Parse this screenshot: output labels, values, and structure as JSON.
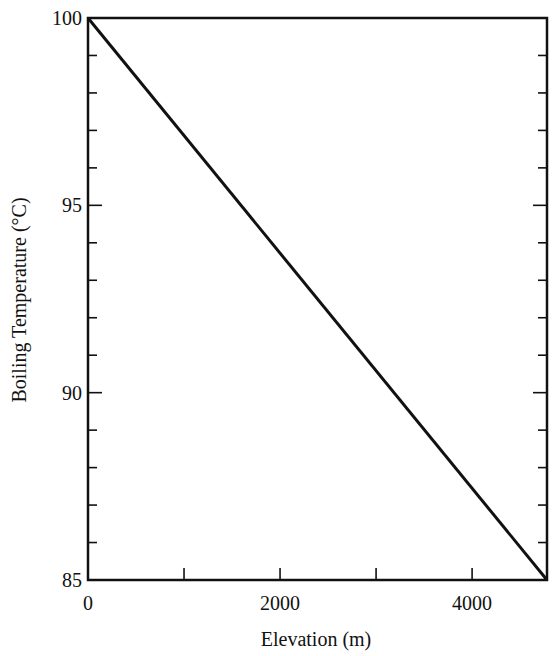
{
  "chart_data": {
    "type": "line",
    "title": "",
    "xlabel": "Elevation (m)",
    "ylabel": "Boiling Temperature (°C)",
    "xlim": [
      0,
      4780
    ],
    "ylim": [
      85,
      100
    ],
    "x_ticks": [
      0,
      1000,
      2000,
      3000,
      4000
    ],
    "x_tick_labels": [
      "0",
      "",
      "2000",
      "",
      "4000"
    ],
    "y_ticks": [
      85,
      86,
      87,
      88,
      89,
      90,
      91,
      92,
      93,
      94,
      95,
      96,
      97,
      98,
      99,
      100
    ],
    "y_tick_labels": {
      "85": "85",
      "90": "90",
      "95": "95",
      "100": "100"
    },
    "grid": false,
    "legend": null,
    "series": [
      {
        "name": "Boiling temperature",
        "x": [
          0,
          4780
        ],
        "y": [
          100,
          85
        ],
        "color": "#111111"
      }
    ]
  },
  "layout": {
    "plot_left": 88,
    "plot_right": 547,
    "plot_top": 18,
    "plot_bottom": 580
  }
}
